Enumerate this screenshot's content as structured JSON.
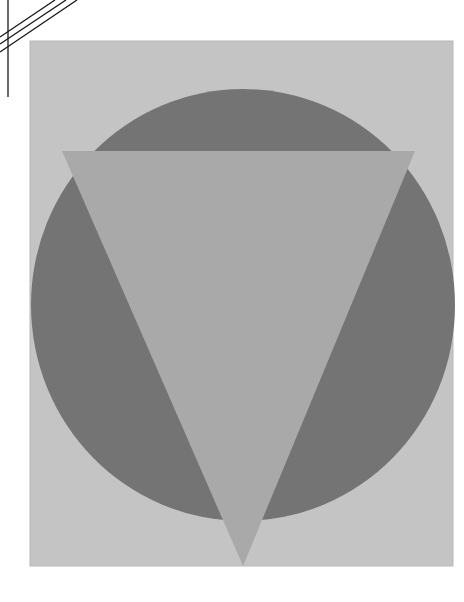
{
  "artwork": {
    "page_background": "#ffffff",
    "panel": {
      "x": 30,
      "y": 41,
      "width": 423,
      "height": 525,
      "color": "#c4c4c4",
      "edge": "#b8b8b8"
    },
    "circle": {
      "cx": 243,
      "cy": 305,
      "rx": 212,
      "ry": 216,
      "color": "#747474"
    },
    "triangle": {
      "points": "62,151 415,151 243,566",
      "color": "#a9a9a9"
    },
    "corner_lines": {
      "color": "#1a1a1a",
      "vertical": {
        "x1": 8,
        "y1": 0,
        "x2": 8,
        "y2": 97
      },
      "diagonals": [
        {
          "x1": 0,
          "y1": 37,
          "x2": 55,
          "y2": 0
        },
        {
          "x1": 0,
          "y1": 44,
          "x2": 66,
          "y2": 0
        },
        {
          "x1": 0,
          "y1": 52,
          "x2": 77,
          "y2": 0
        }
      ]
    }
  }
}
